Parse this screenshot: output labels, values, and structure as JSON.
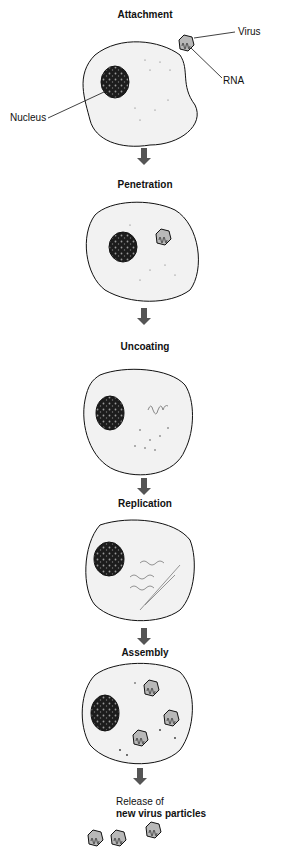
{
  "diagram": {
    "stages": [
      {
        "label": "Attachment"
      },
      {
        "label": "Penetration"
      },
      {
        "label": "Uncoating"
      },
      {
        "label": "Replication"
      },
      {
        "label": "Assembly"
      },
      {
        "label": "Release of",
        "label2": "new virus particles"
      }
    ],
    "callouts": {
      "virus": "Virus",
      "rna": "RNA",
      "nucleus": "Nucleus"
    },
    "colors": {
      "cell_fill": "#f2f2f2",
      "nucleus_fill": "#1c1c1c",
      "virus_fill": "#b8b8b8",
      "arrow": "#555555",
      "outline": "#111111"
    }
  }
}
